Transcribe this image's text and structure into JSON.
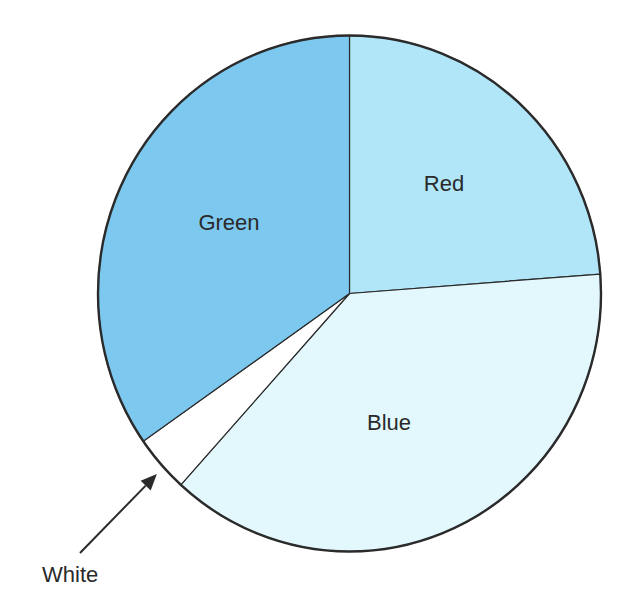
{
  "chart_data": {
    "type": "pie",
    "title": "",
    "start_angle_deg": -90,
    "direction": "clockwise",
    "slices": [
      {
        "label": "Red",
        "value": 23.8,
        "color": "#b0e6f8",
        "label_placement": "inside"
      },
      {
        "label": "Blue",
        "value": 37.9,
        "color": "#e2f8fd",
        "label_placement": "inside"
      },
      {
        "label": "White",
        "value": 3.6,
        "color": "#ffffff",
        "label_placement": "callout-arrow"
      },
      {
        "label": "Green",
        "value": 34.7,
        "color": "#7dc8ef",
        "label_placement": "inside"
      }
    ],
    "legend": "none",
    "outline_color": "#2b2b2b",
    "text_color": "#2a2a2a"
  }
}
